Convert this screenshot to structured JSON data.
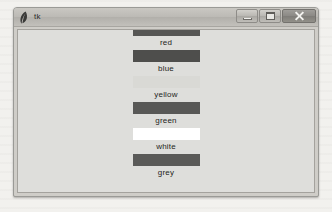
{
  "window": {
    "title": "tk",
    "icon": "feather-icon",
    "controls": [
      {
        "name": "minimize",
        "label": "Minimize",
        "glyph": "minimize-icon"
      },
      {
        "name": "maximize",
        "label": "Maximize",
        "glyph": "maximize-icon"
      },
      {
        "name": "close",
        "label": "Close",
        "glyph": "close-icon"
      }
    ]
  },
  "client": {
    "background": "#dededb",
    "swatches": [
      {
        "label": "red",
        "color": "#565654"
      },
      {
        "label": "blue",
        "color": "#4e4e4c"
      },
      {
        "label": "yellow",
        "color": "#d9d9d5"
      },
      {
        "label": "green",
        "color": "#585856"
      },
      {
        "label": "white",
        "color": "#ffffff"
      },
      {
        "label": "grey",
        "color": "#5a5a58"
      }
    ]
  }
}
